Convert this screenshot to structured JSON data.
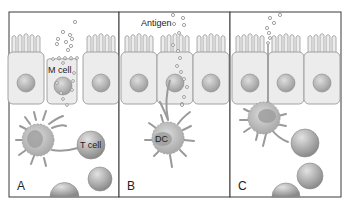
{
  "figure": {
    "panels": [
      {
        "letter": "A",
        "cell_label_top": "M cell",
        "cell_label_bottom": "T cell"
      },
      {
        "letter": "B",
        "antigen_label": "Antigen",
        "dc_label": "DC"
      },
      {
        "letter": "C"
      }
    ]
  },
  "colors": {
    "border": "#3a3a3a",
    "cell_fill": "#ececec",
    "cell_stroke": "#9a9a9a",
    "nucleus": "#b8b8b8",
    "antigen": "#8a8a8a",
    "dc_body": "#b5b5b5",
    "lymphocyte": "#a8a8a8"
  }
}
